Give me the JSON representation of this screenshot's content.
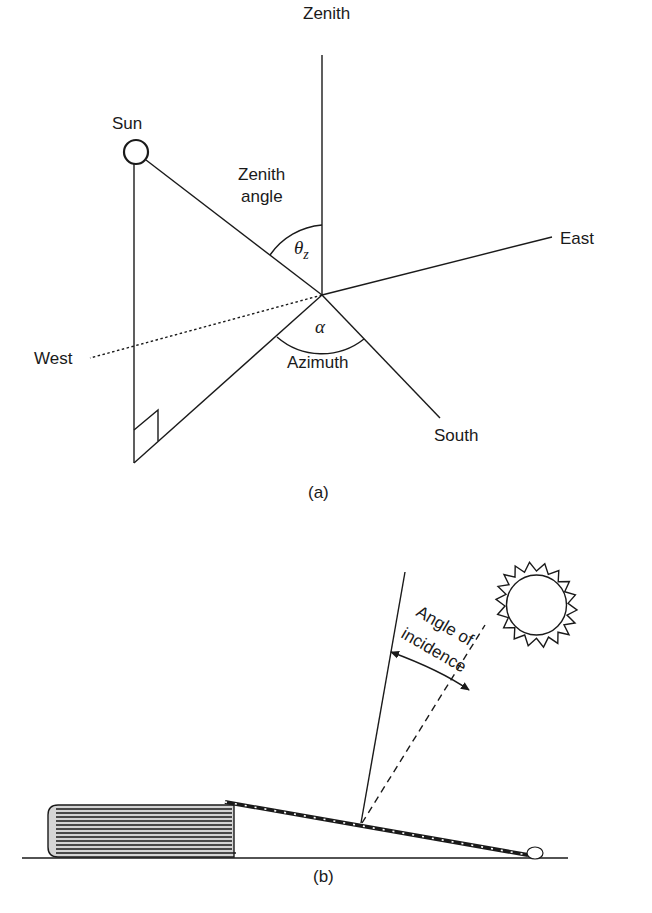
{
  "figure_a": {
    "caption": "(a)",
    "labels": {
      "zenith": "Zenith",
      "sun": "Sun",
      "zenith_angle_line1": "Zenith",
      "zenith_angle_line2": "angle",
      "zenith_symbol": "θ",
      "zenith_symbol_sub": "z",
      "east": "East",
      "west": "West",
      "azimuth_symbol": "α",
      "azimuth": "Azimuth",
      "south": "South"
    }
  },
  "figure_b": {
    "caption": "(b)",
    "labels": {
      "angle_line1": "Angle of",
      "angle_line2": "incidence"
    }
  },
  "colors": {
    "ink": "#1a1a1a",
    "background": "#ffffff",
    "collector_fill": "#c8c8c8"
  }
}
